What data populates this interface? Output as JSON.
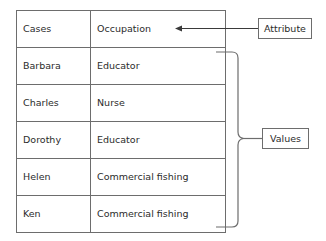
{
  "diagram": {
    "border_color": "#6d6d6d",
    "text_color": "#2b2b2b",
    "background_color": "#ffffff"
  },
  "table": {
    "header": {
      "case_label": "Cases",
      "attribute_label": "Occupation"
    },
    "rows": [
      {
        "case": "Barbara",
        "occupation": "Educator"
      },
      {
        "case": "Charles",
        "occupation": "Nurse"
      },
      {
        "case": "Dorothy",
        "occupation": "Educator"
      },
      {
        "case": "Helen",
        "occupation": "Commercial fishing"
      },
      {
        "case": "Ken",
        "occupation": "Commercial fishing"
      }
    ]
  },
  "annotations": {
    "attribute": {
      "label": "Attribute",
      "connector": "arrow-pointing-left"
    },
    "values": {
      "label": "Values",
      "connector": "curly-brace-right"
    }
  }
}
